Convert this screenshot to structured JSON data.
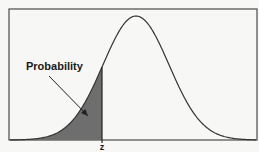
{
  "diagram": {
    "type": "normal-distribution-cdf",
    "annotation_label": "Probability",
    "z_label": "z",
    "colors": {
      "background": "#f7f7f6",
      "frame": "#4a4a4a",
      "curve": "#333333",
      "shaded_area": "#6e6e6e",
      "arrow": "#222222",
      "text": "#1a1a1a"
    },
    "geometry": {
      "frame": {
        "x": 9,
        "y": 9,
        "width": 248,
        "height": 131
      },
      "baseline_y": 140,
      "peak": {
        "x": 136,
        "y": 16
      },
      "sigma_px": 33,
      "z_x": 102,
      "arrow": {
        "x1": 49,
        "y1": 76,
        "x2": 88,
        "y2": 116
      },
      "label_pos": {
        "x": 26,
        "y": 70
      },
      "z_label_pos": {
        "x": 102,
        "y": 150
      }
    }
  }
}
